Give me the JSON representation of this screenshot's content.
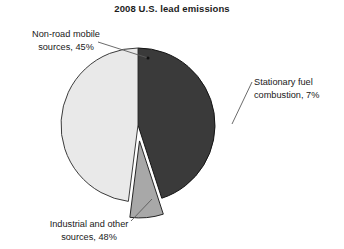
{
  "chart_data": {
    "type": "pie",
    "title": "2008 U.S. lead emissions",
    "categories": [
      "Non-road mobile sources",
      "Stationary fuel combustion",
      "Industrial and other sources"
    ],
    "values": [
      45,
      7,
      48
    ],
    "value_unit": "%",
    "colors": [
      "#3a3a3a",
      "#a8a8a8",
      "#e9e9e9"
    ],
    "exploded": [
      false,
      true,
      false
    ],
    "legend": "none",
    "grid": false,
    "labels": [
      {
        "name": "non-road-mobile",
        "line1": "Non-road mobile",
        "line2": "sources, 45%",
        "value": 45,
        "color": "#3a3a3a"
      },
      {
        "name": "stationary-fuel",
        "line1": "Stationary fuel",
        "line2": "combustion, 7%",
        "value": 7,
        "color": "#a8a8a8"
      },
      {
        "name": "industrial-other",
        "line1": "Industrial and other",
        "line2": "sources, 48%",
        "value": 48,
        "color": "#e9e9e9"
      }
    ]
  },
  "chart": {
    "title": "2008 U.S. lead emissions"
  },
  "annotations": {
    "nonroad": {
      "line1": "Non-road mobile",
      "line2": "sources, 45%"
    },
    "stationary": {
      "line1": "Stationary fuel",
      "line2": "combustion, 7%"
    },
    "industrial": {
      "line1": "Industrial and other",
      "line2": "sources, 48%"
    }
  }
}
